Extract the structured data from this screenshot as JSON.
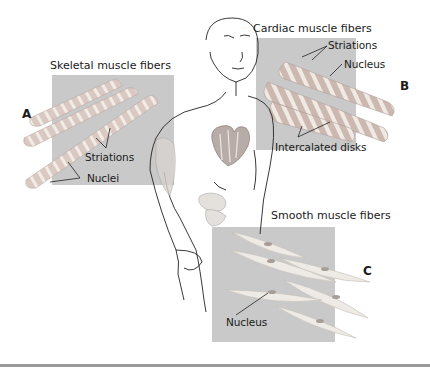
{
  "figure": {
    "panels": [
      {
        "id": "A",
        "letter": "A",
        "title": "Skeletal muscle fibers",
        "labels": [
          "Striations",
          "Nuclei"
        ]
      },
      {
        "id": "B",
        "letter": "B",
        "title": "Cardiac muscle fibers",
        "labels": [
          "Striations",
          "Nucleus",
          "Intercalated disks"
        ]
      },
      {
        "id": "C",
        "letter": "C",
        "title": "Smooth muscle fibers",
        "labels": [
          "Nucleus"
        ]
      }
    ],
    "colors": {
      "panel_background": "#c9c9c9",
      "fiber_fill": "#e2d6cf",
      "striation": "#f4efe9",
      "outline": "#222222",
      "rule": "#9a9a9a"
    }
  }
}
